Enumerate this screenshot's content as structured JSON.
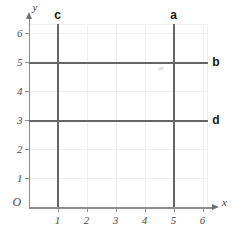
{
  "figure": {
    "title": "",
    "background_color": "#ffffff",
    "origin_label": "O",
    "x_axis_label": "x",
    "y_axis_label": "y"
  },
  "chart_data": {
    "type": "line",
    "title": "",
    "xlabel": "x",
    "ylabel": "y",
    "xlim": [
      0,
      6.4
    ],
    "ylim": [
      0,
      6.4
    ],
    "grid": true,
    "legend": "none",
    "x_ticks": [
      "1",
      "2",
      "3",
      "4",
      "5",
      "6"
    ],
    "y_ticks": [
      "1",
      "2",
      "3",
      "4",
      "5",
      "6"
    ],
    "x_tick_values": [
      1,
      2,
      3,
      4,
      5,
      6
    ],
    "y_tick_values": [
      1,
      2,
      3,
      4,
      5,
      6
    ],
    "series": [
      {
        "name": "c",
        "label": "c",
        "orientation": "vertical",
        "equation": "x = 1",
        "value": 1,
        "x": [
          1,
          1
        ],
        "y": [
          0,
          6.3
        ],
        "label_position": "top",
        "color": "#656565"
      },
      {
        "name": "a",
        "label": "a",
        "orientation": "vertical",
        "equation": "x = 5",
        "value": 5,
        "x": [
          5,
          5
        ],
        "y": [
          0,
          6.3
        ],
        "label_position": "top",
        "color": "#656565"
      },
      {
        "name": "b",
        "label": "b",
        "orientation": "horizontal",
        "equation": "y = 5",
        "value": 5,
        "x": [
          0,
          6.2
        ],
        "y": [
          5,
          5
        ],
        "label_position": "right",
        "color": "#656565"
      },
      {
        "name": "d",
        "label": "d",
        "orientation": "horizontal",
        "equation": "y = 3",
        "value": 3,
        "x": [
          0,
          6.2
        ],
        "y": [
          3,
          3
        ],
        "label_position": "right",
        "color": "#656565"
      }
    ],
    "colors": {
      "line": "#656565",
      "axis": "#8d8d8d",
      "grid": "#f0eeee",
      "label": "#151515",
      "tick_label": "#4a4a4a"
    }
  }
}
